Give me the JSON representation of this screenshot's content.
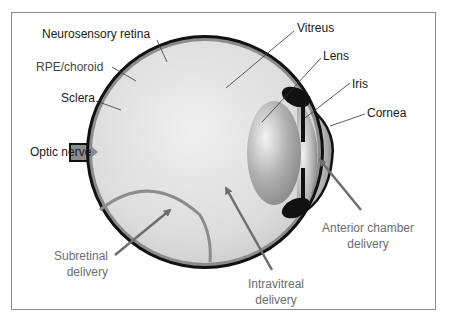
{
  "figure": {
    "anatomy_labels": {
      "neurosensory_retina": "Neurosensory retina",
      "rpe_choroid": "RPE/choroid",
      "sclera": "Sclera",
      "optic_nerve": "Optic nerve",
      "vitreus": "Vitreus",
      "lens": "Lens",
      "iris": "Iris",
      "cornea": "Cornea"
    },
    "delivery_routes": {
      "subretinal": {
        "line1": "Subretinal",
        "line2": "delivery"
      },
      "intravitreal": {
        "line1": "Intravitreal",
        "line2": "delivery"
      },
      "anterior_chamber": {
        "line1": "Anterior chamber",
        "line2": "delivery"
      }
    },
    "colors": {
      "frame": "#8a8a8a",
      "sclera": "#111111",
      "choroid": "#8c8c8c",
      "vitreous": "#d8d8d8",
      "arrow": "#6e6e6e",
      "label_dark": "#1a1a1a",
      "label_grey": "#6e6e6e"
    }
  }
}
